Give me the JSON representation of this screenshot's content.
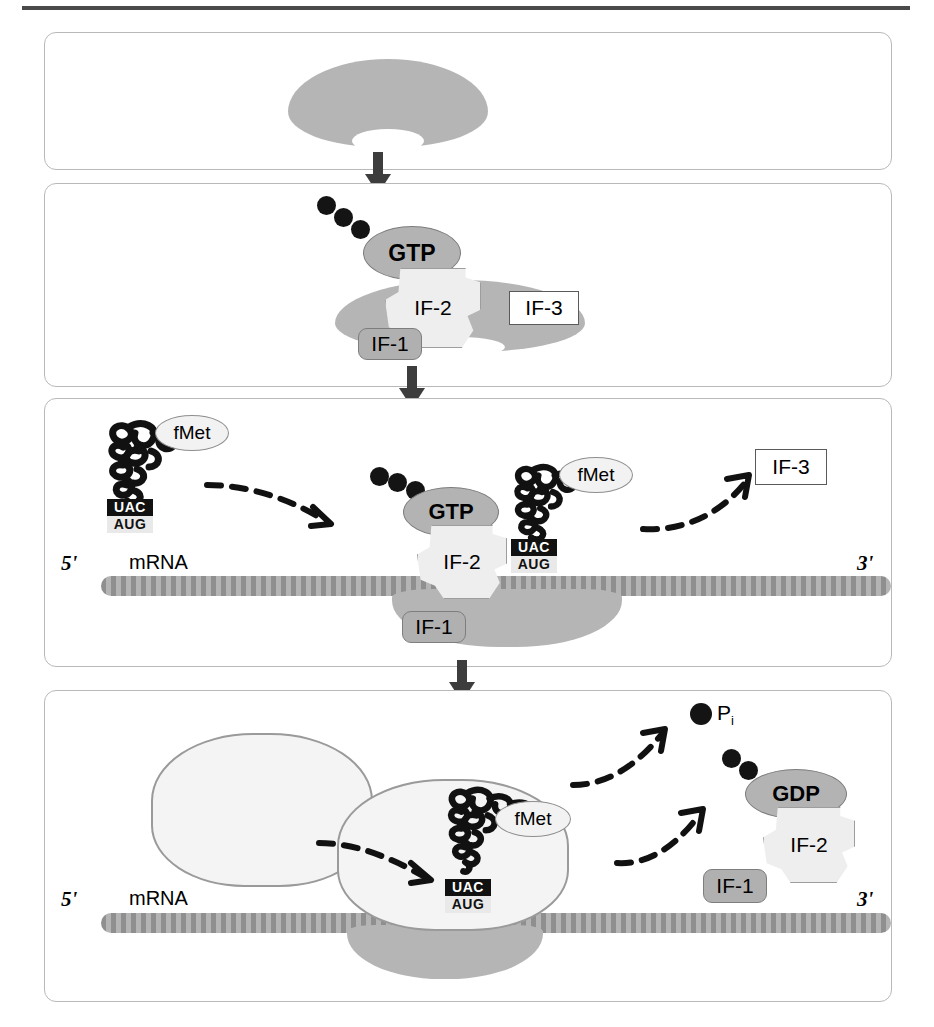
{
  "figure": {
    "colors": {
      "subunit_30s": "#b5b5b5",
      "subunit_50s": "#f4f4f4",
      "mrna": "#8f8f8f",
      "nucleotide": "#b3b3b3",
      "if2": "#eeeeee",
      "if1": "#b0b0b0",
      "if3": "#ffffff",
      "phosphate": "#141414",
      "arrow": "#3d3d3d",
      "panel_border": "#b9b9b9"
    }
  },
  "panels": [
    {
      "id": "panel-1",
      "name": "free-30s-subunit",
      "shapes": [
        {
          "name": "30s-ribosomal-subunit",
          "label": ""
        }
      ]
    },
    {
      "id": "panel-2",
      "name": "initiation-factors-bind-30s",
      "shapes": [
        {
          "name": "30s-ribosomal-subunit",
          "label": ""
        },
        {
          "name": "gtp-nucleotide",
          "label": "GTP"
        },
        {
          "name": "initiation-factor-2",
          "label": "IF-2"
        },
        {
          "name": "initiation-factor-3",
          "label": "IF-3"
        },
        {
          "name": "initiation-factor-1",
          "label": "IF-1"
        }
      ]
    },
    {
      "id": "panel-3",
      "name": "initiator-trna-binds-mrna",
      "shapes": [
        {
          "name": "initiator-trna-free",
          "label": "fMet"
        },
        {
          "name": "initiator-trna-bound",
          "label": "fMet"
        },
        {
          "name": "gtp-nucleotide",
          "label": "GTP"
        },
        {
          "name": "initiation-factor-2",
          "label": "IF-2"
        },
        {
          "name": "initiation-factor-1",
          "label": "IF-1"
        },
        {
          "name": "initiation-factor-3-released",
          "label": "IF-3"
        }
      ]
    },
    {
      "id": "panel-4",
      "name": "50s-joins-factors-released",
      "shapes": [
        {
          "name": "50s-ribosomal-subunit-free",
          "label": ""
        },
        {
          "name": "50s-ribosomal-subunit-joined",
          "label": ""
        },
        {
          "name": "30s-ribosomal-subunit",
          "label": ""
        },
        {
          "name": "initiator-trna-bound",
          "label": "fMet"
        },
        {
          "name": "inorganic-phosphate",
          "label": "P",
          "subscript": "i"
        },
        {
          "name": "gdp-nucleotide",
          "label": "GDP"
        },
        {
          "name": "initiation-factor-2-released",
          "label": "IF-2"
        },
        {
          "name": "initiation-factor-1-released",
          "label": "IF-1"
        }
      ]
    }
  ],
  "labels": {
    "gtp": "GTP",
    "gdp": "GDP",
    "if1": "IF-1",
    "if2": "IF-2",
    "if3": "IF-3",
    "fmet": "fMet",
    "mrna": "mRNA",
    "five_prime": "5'",
    "three_prime": "3'",
    "anticodon": "UAC",
    "codon": "AUG",
    "phosphate": "P",
    "phosphate_subscript": "i"
  }
}
